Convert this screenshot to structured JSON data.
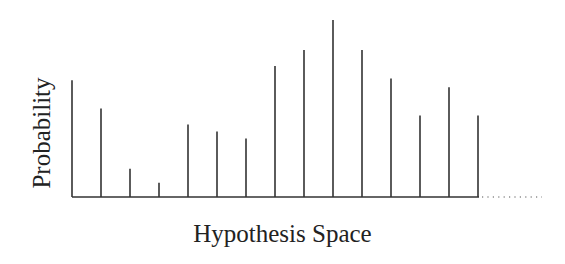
{
  "chart_data": {
    "type": "stem",
    "title": "",
    "xlabel": "Hypothesis Space",
    "ylabel": "Probability",
    "categories": [
      "h1",
      "h2",
      "h3",
      "h4",
      "h5",
      "h6",
      "h7",
      "h8",
      "h9",
      "h10",
      "h11",
      "h12",
      "h13",
      "h14",
      "h15"
    ],
    "values": [
      0.66,
      0.5,
      0.16,
      0.08,
      0.41,
      0.37,
      0.33,
      0.74,
      0.83,
      1.0,
      0.83,
      0.67,
      0.46,
      0.62,
      0.46
    ],
    "ylim": [
      0,
      1
    ],
    "grid": false,
    "legend": null,
    "x_ticks_labeled": false,
    "y_ticks_labeled": false,
    "continuation": "dotted baseline extension to the right indicating more hypotheses",
    "color": "#333333"
  }
}
